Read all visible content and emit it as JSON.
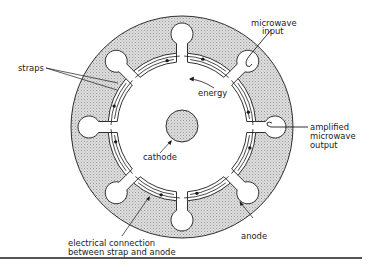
{
  "diagram": {
    "type": "cavity magnetron cross-section",
    "colors": {
      "anode_fill": "#d6d6d6",
      "stroke": "#1a1a1a",
      "background": "#ffffff",
      "rule": "#555555"
    },
    "labels": {
      "straps": "straps",
      "microwave_input_1": "microwave",
      "microwave_input_2": "input",
      "energy": "energy",
      "cathode": "cathode",
      "output_1": "amplified",
      "output_2": "microwave",
      "output_3": "output",
      "connection_1": "electrical connection",
      "connection_2": "between strap and anode",
      "anode": "anode"
    },
    "cavity_count": 8
  }
}
